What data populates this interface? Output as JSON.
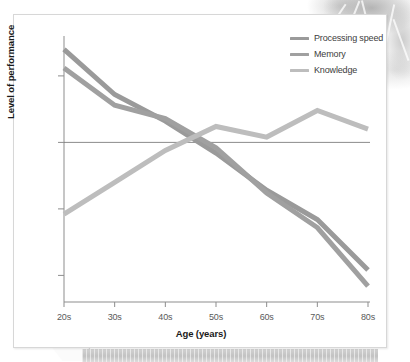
{
  "figure": {
    "y_axis_title": "Level of performance",
    "x_axis_title": "Age (years)"
  },
  "legend": {
    "items": [
      {
        "label": "Processing speed",
        "color": "#9a9a9a",
        "swatch_name": "legend-swatch-processing-speed"
      },
      {
        "label": "Memory",
        "color": "#a0a0a0",
        "swatch_name": "legend-swatch-memory"
      },
      {
        "label": "Knowledge",
        "color": "#bdbdbd",
        "swatch_name": "legend-swatch-knowledge"
      }
    ]
  },
  "chart_data": {
    "type": "line",
    "title": "",
    "xlabel": "Age (years)",
    "ylabel": "Level of performance",
    "categories": [
      "20s",
      "30s",
      "40s",
      "50s",
      "60s",
      "70s",
      "80s"
    ],
    "x_tick_labels": [
      "20s",
      "30s",
      "40s",
      "50s",
      "60s",
      "70s",
      "80s"
    ],
    "y_tick_labels": [],
    "ylim": [
      0,
      100
    ],
    "y_ticks": [
      10,
      35,
      60,
      85
    ],
    "grid": false,
    "reference_line_y": 60,
    "legend_position": "top-right",
    "series": [
      {
        "name": "Processing speed",
        "color": "#9a9a9a",
        "values": [
          95,
          78,
          68,
          56,
          42,
          31,
          12
        ]
      },
      {
        "name": "Memory",
        "color": "#a0a0a0",
        "values": [
          88,
          74,
          69,
          58,
          41,
          28,
          6
        ]
      },
      {
        "name": "Knowledge",
        "color": "#bdbdbd",
        "values": [
          33,
          45,
          57,
          66,
          62,
          72,
          65
        ]
      }
    ],
    "annotations": [
      "Processing speed and Memory decline steadily with age",
      "Knowledge rises through midlife and plateaus",
      "Lines cross near the 50s"
    ]
  }
}
